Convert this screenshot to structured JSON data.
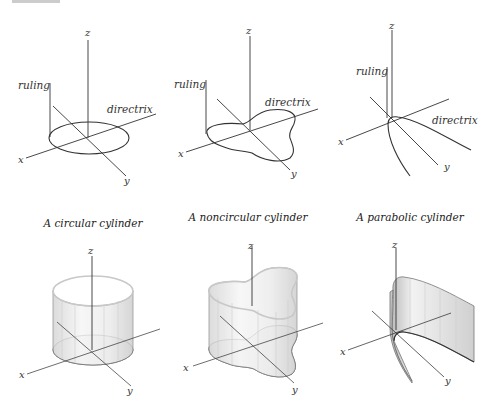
{
  "figure": {
    "panels": [
      {
        "id": "circular-directrix",
        "axes": {
          "x": "x",
          "y": "y",
          "z": "z"
        },
        "annotations": {
          "ruling": "ruling",
          "directrix": "directrix"
        }
      },
      {
        "id": "noncircular-directrix",
        "axes": {
          "x": "x",
          "y": "y",
          "z": "z"
        },
        "annotations": {
          "ruling": "ruling",
          "directrix": "directrix"
        }
      },
      {
        "id": "parabolic-directrix",
        "axes": {
          "x": "x",
          "y": "y",
          "z": "z"
        },
        "annotations": {
          "ruling": "ruling",
          "directrix": "directrix"
        }
      },
      {
        "id": "circular-cylinder",
        "caption": "A circular cylinder",
        "axes": {
          "x": "x",
          "y": "y",
          "z": "z"
        }
      },
      {
        "id": "noncircular-cylinder",
        "caption": "A noncircular cylinder",
        "axes": {
          "x": "x",
          "y": "y",
          "z": "z"
        }
      },
      {
        "id": "parabolic-cylinder",
        "caption": "A parabolic cylinder",
        "axes": {
          "x": "x",
          "y": "y",
          "z": "z"
        }
      }
    ],
    "colors": {
      "line": "#333333",
      "surface_light": "#f4f4f4",
      "surface_dark": "#c9c9c9"
    }
  }
}
